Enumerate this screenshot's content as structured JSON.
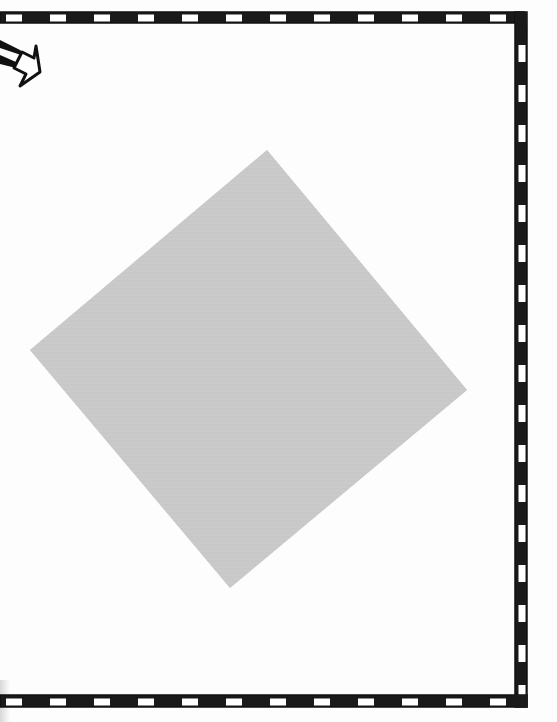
{
  "page": {
    "width": 557,
    "height": 722,
    "background": "#fdfdfd"
  },
  "border": {
    "style": "hand-drawn checkered film-strip border",
    "sides": [
      "top",
      "right",
      "bottom"
    ],
    "fill_dark": "#1a1a1a",
    "fill_light": "#ffffff",
    "top": {
      "x1": 0,
      "y1": 17,
      "x2": 524,
      "y2": 17,
      "thickness": 11
    },
    "right": {
      "x1": 521,
      "y1": 17,
      "x2": 521,
      "y2": 702,
      "thickness": 12
    },
    "bottom": {
      "x1": 0,
      "y1": 701,
      "x2": 524,
      "y2": 701,
      "thickness": 11
    }
  },
  "arrow": {
    "icon": "arrow-down-right-icon",
    "direction": "down-right",
    "tip": {
      "x": 43,
      "y": 78
    },
    "color": "#111111"
  },
  "diamond": {
    "shape": "rotated-square",
    "fill": "#c9c9c9",
    "corners": {
      "top": {
        "x": 267,
        "y": 150
      },
      "right": {
        "x": 467,
        "y": 390
      },
      "bottom": {
        "x": 230,
        "y": 588
      },
      "left": {
        "x": 30,
        "y": 350
      }
    }
  }
}
